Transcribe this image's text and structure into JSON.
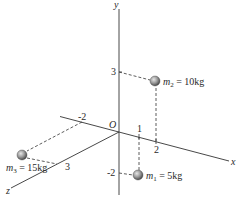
{
  "diagram": {
    "type": "3d-coordinate-system",
    "axes": {
      "x_label": "x",
      "y_label": "y",
      "z_label": "z",
      "origin_label": "O"
    },
    "ticks": {
      "y_pos_3": "3",
      "y_neg_2": "-2",
      "x_pos_1": "1",
      "x_pos_2": "2",
      "x_neg_2": "-2",
      "z_pos_3": "3"
    },
    "masses": [
      {
        "name": "m",
        "sub": "1",
        "eq": " = 5kg",
        "position": [
          1,
          -2,
          0
        ]
      },
      {
        "name": "m",
        "sub": "2",
        "eq": " = 10kg",
        "position": [
          2,
          3,
          0
        ]
      },
      {
        "name": "m",
        "sub": "3",
        "eq": " = 15kg",
        "position": [
          -2,
          0,
          3
        ]
      }
    ],
    "colors": {
      "axis": "#333333",
      "dash": "#333333",
      "sphere_light": "#d8d8d8",
      "sphere_dark": "#555555"
    }
  }
}
